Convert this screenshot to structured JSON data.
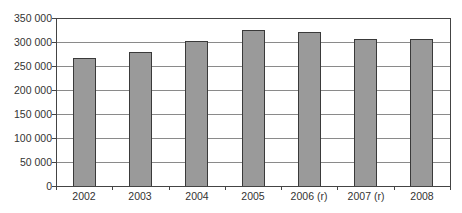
{
  "chart_data": {
    "type": "bar",
    "title": "",
    "xlabel": "",
    "ylabel": "",
    "categories": [
      "2002",
      "2003",
      "2004",
      "2005",
      "2006 (r)",
      "2007 (r)",
      "2008"
    ],
    "values": [
      266700,
      279000,
      302700,
      325000,
      321400,
      305600,
      305600
    ],
    "ylim": [
      0,
      350000
    ],
    "yticks": [
      0,
      50000,
      100000,
      150000,
      200000,
      250000,
      300000,
      350000
    ],
    "ytick_labels": [
      "0",
      "50 000",
      "100 000",
      "150 000",
      "200 000",
      "250 000",
      "300 000",
      "350 000"
    ],
    "grid": true,
    "legend": null,
    "bar_color": "#9a9a9a",
    "bar_edge_color": "#3a3a3a"
  }
}
